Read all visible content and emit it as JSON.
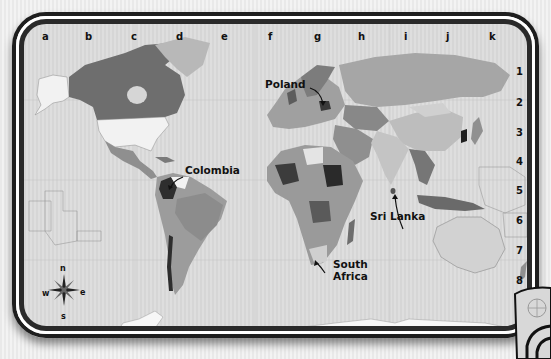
{
  "map": {
    "type": "world political map",
    "color_mode": "grayscale",
    "grid": {
      "columns": [
        "a",
        "b",
        "c",
        "d",
        "e",
        "f",
        "g",
        "h",
        "i",
        "j",
        "k"
      ],
      "rows": [
        "1",
        "2",
        "3",
        "4",
        "5",
        "6",
        "7",
        "8"
      ]
    },
    "labels": [
      {
        "id": "poland",
        "text": "Poland"
      },
      {
        "id": "colombia",
        "text": "Colombia"
      },
      {
        "id": "sri_lanka",
        "text": "Sri Lanka"
      },
      {
        "id": "south_africa_line1",
        "text": "South"
      },
      {
        "id": "south_africa_line2",
        "text": "Africa"
      }
    ],
    "compass": {
      "n": "n",
      "s": "s",
      "e": "e",
      "w": "w"
    },
    "colors": {
      "ocean": "#d9d9d9",
      "frame": "#1e1e1e",
      "land_light": "#f2f2f2",
      "land_mid": "#a9a9a9",
      "land_dark": "#6a6a6a",
      "land_darkest": "#2e2e2e"
    }
  }
}
